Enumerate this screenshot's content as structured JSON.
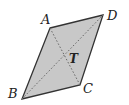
{
  "figure": {
    "shape": "parallelogram",
    "fill_color": "#c8c8c8",
    "stroke_color": "#333333",
    "vertices": {
      "A": {
        "label": "A",
        "x": 50,
        "y": 28
      },
      "D": {
        "label": "D",
        "x": 103,
        "y": 15
      },
      "C": {
        "label": "C",
        "x": 80,
        "y": 85
      },
      "B": {
        "label": "B",
        "x": 22,
        "y": 99
      }
    },
    "diagonals": [
      {
        "from": "A",
        "to": "C",
        "style": "dotted"
      },
      {
        "from": "B",
        "to": "D",
        "style": "dotted"
      }
    ],
    "center_label": "T"
  }
}
